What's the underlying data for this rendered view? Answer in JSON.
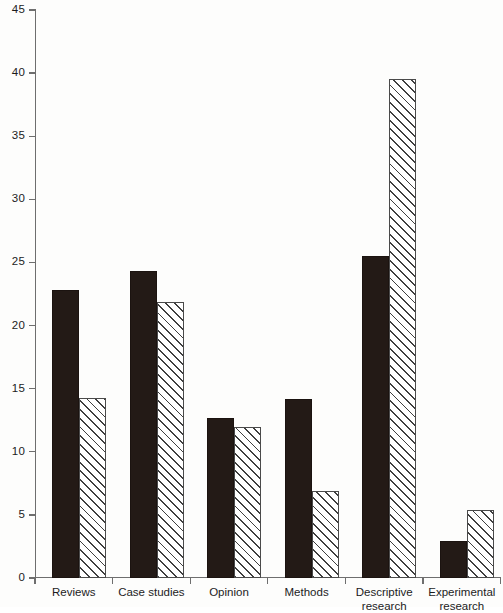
{
  "chart_data": {
    "type": "bar",
    "title": "",
    "subtitle": "",
    "xlabel": "",
    "ylabel": "",
    "ylim": [
      0,
      45
    ],
    "ytick_step": 5,
    "yticks": [
      "0",
      "5",
      "10",
      "15",
      "20",
      "25",
      "30",
      "35",
      "40",
      "45"
    ],
    "grid": false,
    "legend_position": "none",
    "categories": [
      "Reviews",
      "Case studies",
      "Opinion",
      "Methods",
      "Descriptive\nresearch",
      "Experimental\nresearch"
    ],
    "series": [
      {
        "name": "series-solid",
        "style": "solid-black",
        "color": "#231a16",
        "values": [
          22.8,
          24.3,
          12.7,
          14.2,
          25.5,
          2.9
        ]
      },
      {
        "name": "series-hatched",
        "style": "diagonal-hatch",
        "color": "#ffffff",
        "values": [
          14.3,
          21.9,
          12.0,
          6.9,
          39.5,
          5.4
        ]
      }
    ]
  },
  "figure": {
    "background_color": "#fdfdfc",
    "axis_color": "#6e6e6e",
    "tick_label_color": "#1c1c1c"
  }
}
